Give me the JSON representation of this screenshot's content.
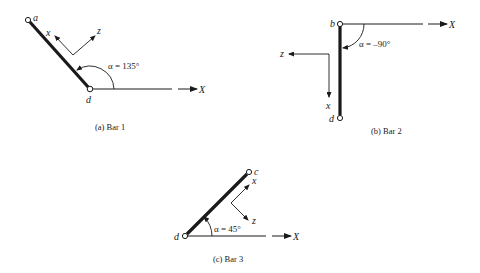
{
  "figure": {
    "bars": [
      {
        "id": "bar1",
        "caption": "(a) Bar 1",
        "start_node": "a",
        "end_node": "d",
        "angle_label": "α = 135°",
        "global_axis": "X",
        "local_axes": {
          "x": "x",
          "z": "z"
        }
      },
      {
        "id": "bar2",
        "caption": "(b) Bar 2",
        "start_node": "b",
        "end_node": "d",
        "angle_label": "α = –90°",
        "global_axis": "X",
        "local_axes": {
          "x": "x",
          "z": "z"
        }
      },
      {
        "id": "bar3",
        "caption": "(c) Bar 3",
        "start_node": "c",
        "end_node": "d",
        "angle_label": "α = 45°",
        "global_axis": "X",
        "local_axes": {
          "x": "x",
          "z": "z"
        }
      }
    ],
    "colors": {
      "ink": "#1a1a1a",
      "background": "#ffffff"
    }
  }
}
